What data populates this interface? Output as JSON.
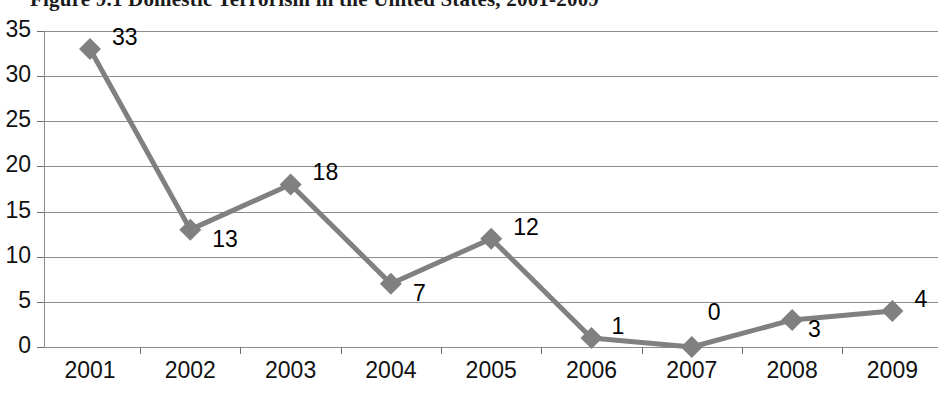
{
  "chart_data": {
    "type": "line",
    "title": "Figure 9.1  Domestic Terrorism in the United States, 2001-2009",
    "xlabel": "",
    "ylabel": "",
    "categories": [
      "2001",
      "2002",
      "2003",
      "2004",
      "2005",
      "2006",
      "2007",
      "2008",
      "2009"
    ],
    "values": [
      33,
      13,
      18,
      7,
      12,
      1,
      0,
      3,
      4
    ],
    "point_labels": [
      "33",
      "13",
      "18",
      "7",
      "12",
      "1",
      "0",
      "3",
      "4"
    ],
    "ylim": [
      0,
      35
    ],
    "ytick_labels": [
      "0",
      "5",
      "10",
      "15",
      "20",
      "25",
      "30",
      "35"
    ],
    "ytick_values": [
      0,
      5,
      10,
      15,
      20,
      25,
      30,
      35
    ],
    "grid": "horizontal",
    "legend": "none",
    "marker": "diamond",
    "series_color": "#808080",
    "grid_color": "#8c8c8c",
    "label_color": "#000000"
  }
}
